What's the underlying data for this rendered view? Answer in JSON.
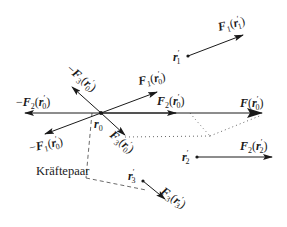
{
  "diagram": {
    "type": "force-system-reduction",
    "origin": {
      "label": "r0",
      "text": "r",
      "sub": "0",
      "x": 101,
      "y": 113
    },
    "points": [
      {
        "id": "r1",
        "text": "r",
        "sub": "1",
        "prime": "′",
        "x": 188,
        "y": 56
      },
      {
        "id": "r2",
        "text": "r",
        "sub": "2",
        "prime": "′",
        "x": 197,
        "y": 157
      },
      {
        "id": "r3",
        "text": "r",
        "sub": "3",
        "prime": "′",
        "x": 143,
        "y": 181
      }
    ],
    "forces_at_points": [
      {
        "id": "F1_r1",
        "F": "F",
        "sub": "1",
        "arg": "r",
        "argsub": "1",
        "from": [
          188,
          56
        ],
        "to": [
          243,
          35
        ]
      },
      {
        "id": "F2_r2",
        "F": "F",
        "sub": "2",
        "arg": "r",
        "argsub": "2",
        "from": [
          197,
          157
        ],
        "to": [
          272,
          157
        ]
      },
      {
        "id": "F3_r3",
        "F": "F",
        "sub": "3",
        "arg": "r",
        "argsub": "3",
        "from": [
          143,
          181
        ],
        "to": [
          163,
          198
        ]
      }
    ],
    "forces_at_origin": [
      {
        "id": "F1_r0",
        "sign": "",
        "F": "F",
        "sub": "1",
        "to": [
          157,
          92
        ]
      },
      {
        "id": "F2_r0",
        "sign": "",
        "F": "F",
        "sub": "2",
        "to": [
          176,
          113
        ]
      },
      {
        "id": "F3_r0",
        "sign": "",
        "F": "F",
        "sub": "3",
        "to": [
          125,
          133
        ]
      },
      {
        "id": "mF1_r0",
        "sign": "−",
        "F": "F",
        "sub": "1",
        "to": [
          45,
          134
        ]
      },
      {
        "id": "mF2_r0",
        "sign": "−",
        "F": "F",
        "sub": "2",
        "to": [
          25,
          113
        ]
      },
      {
        "id": "mF3_r0",
        "sign": "−",
        "F": "F",
        "sub": "3",
        "to": [
          77,
          92
        ]
      },
      {
        "id": "F_r0",
        "sign": "",
        "F": "F",
        "sub": "",
        "to": [
          262,
          113
        ]
      }
    ],
    "annotation": {
      "text": "Kräftepaar"
    },
    "labels": {
      "F1_r1": {
        "sign": "",
        "F": "F",
        "sub": "1",
        "arg": "r",
        "argsub": "1"
      },
      "F2_r2": {
        "sign": "",
        "F": "F",
        "sub": "2",
        "arg": "r",
        "argsub": "2"
      },
      "F3_r3": {
        "sign": "",
        "F": "F",
        "sub": "3",
        "arg": "r",
        "argsub": "3"
      },
      "F1_r0": {
        "sign": "",
        "F": "F",
        "sub": "1",
        "arg": "r",
        "argsub": "0"
      },
      "F2_r0": {
        "sign": "",
        "F": "F",
        "sub": "2",
        "arg": "r",
        "argsub": "0"
      },
      "F3_r0": {
        "sign": "",
        "F": "F",
        "sub": "3",
        "arg": "r",
        "argsub": "0"
      },
      "mF1_r0": {
        "sign": "−",
        "F": "F",
        "sub": "1",
        "arg": "r",
        "argsub": "0"
      },
      "mF2_r0": {
        "sign": "−",
        "F": "F",
        "sub": "2",
        "arg": "r",
        "argsub": "0"
      },
      "mF3_r0": {
        "sign": "−",
        "F": "F",
        "sub": "3",
        "arg": "r",
        "argsub": "0"
      },
      "F_r0": {
        "sign": "",
        "F": "F",
        "sub": "",
        "arg": "r",
        "argsub": "0"
      }
    },
    "colors": {
      "line": "#1a1a1a",
      "dotted": "#555555"
    }
  }
}
